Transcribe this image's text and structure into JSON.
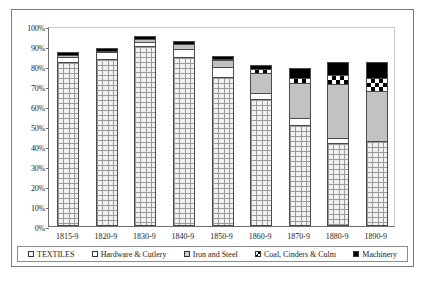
{
  "chart_data": {
    "type": "bar",
    "subtype": "stacked-column",
    "title": "",
    "xlabel": "",
    "ylabel": "",
    "ylim": [
      0,
      100
    ],
    "ytick_labels": [
      "0%",
      "10%",
      "20%",
      "30%",
      "40%",
      "50%",
      "60%",
      "70%",
      "80%",
      "90%",
      "100%"
    ],
    "ytick_values": [
      0,
      10,
      20,
      30,
      40,
      50,
      60,
      70,
      80,
      90,
      100
    ],
    "grid": false,
    "legend_position": "bottom",
    "categories": [
      "1815-9",
      "1820-9",
      "1830-9",
      "1840-9",
      "1850-9",
      "1860-9",
      "1870-9",
      "1880-9",
      "1890-9"
    ],
    "series": [
      {
        "name": "TEXTILES",
        "pattern": "brick",
        "color": "#f2f2f2",
        "values": [
          82.0,
          83.5,
          90.0,
          84.5,
          74.5,
          63.5,
          50.5,
          41.5,
          42.5
        ]
      },
      {
        "name": "Hardware & Cutlery",
        "pattern": "white",
        "color": "#ffffff",
        "values": [
          2.5,
          3.5,
          2.0,
          4.0,
          5.0,
          3.0,
          3.5,
          2.5,
          0.0
        ]
      },
      {
        "name": "Iron and Steel",
        "pattern": "solid-gray",
        "color": "#c2c2c2",
        "values": [
          1.0,
          0.5,
          1.5,
          2.5,
          3.5,
          10.0,
          17.5,
          27.0,
          25.0
        ]
      },
      {
        "name": "Coal, Cinders & Culm",
        "pattern": "checkerboard",
        "color": "#000000",
        "values": [
          0.0,
          0.0,
          0.0,
          0.0,
          0.5,
          2.0,
          2.5,
          4.5,
          6.5
        ]
      },
      {
        "name": "Machinery",
        "pattern": "solid-black",
        "color": "#000000",
        "values": [
          1.5,
          1.5,
          1.5,
          1.5,
          1.5,
          2.0,
          5.0,
          6.5,
          8.0
        ]
      }
    ],
    "totals": [
      87.0,
      89.0,
      95.0,
      92.5,
      85.0,
      80.5,
      79.0,
      82.0,
      82.0
    ]
  },
  "legend": {
    "items": [
      {
        "label": "TEXTILES",
        "swatch": "textiles"
      },
      {
        "label": "Hardware & Cutlery",
        "swatch": "hardware"
      },
      {
        "label": "Iron and Steel",
        "swatch": "iron"
      },
      {
        "label": "Coal, Cinders & Culm",
        "swatch": "coal"
      },
      {
        "label": "Machinery",
        "swatch": "machinery"
      }
    ]
  }
}
